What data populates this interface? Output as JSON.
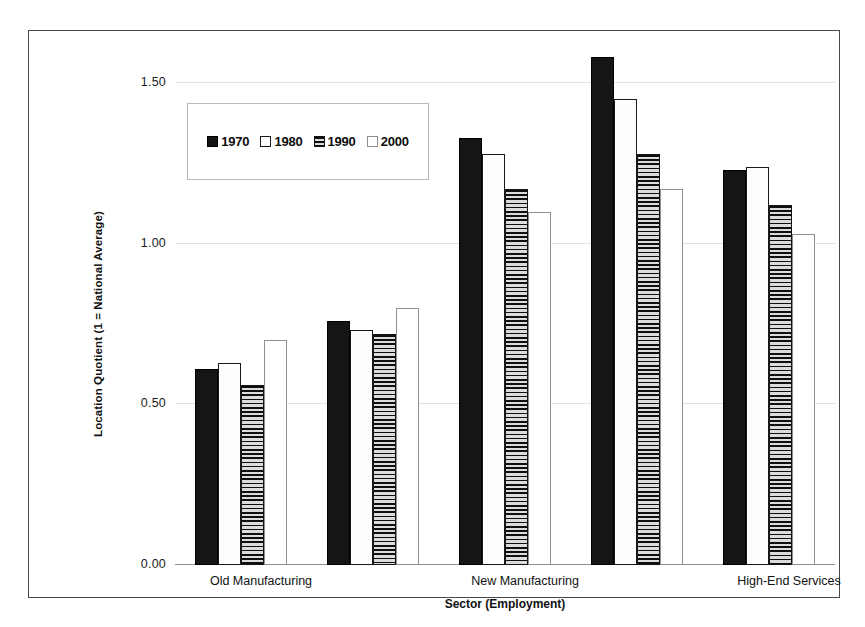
{
  "chart_data": {
    "type": "bar",
    "title": "",
    "subtitle": "",
    "xlabel": "Sector (Employment)",
    "ylabel": "Location Quotient (1 = National Average)",
    "categories": [
      "Old Manufacturing",
      "New Manufacturing",
      "High-End Services",
      "Low-End Services",
      "FIRE"
    ],
    "series": [
      {
        "name": "1970",
        "pattern": "solid-black",
        "values": [
          0.61,
          0.76,
          1.33,
          1.58,
          1.23
        ]
      },
      {
        "name": "1980",
        "pattern": "white-filled",
        "values": [
          0.63,
          0.73,
          1.28,
          1.45,
          1.24
        ]
      },
      {
        "name": "1990",
        "pattern": "horizontal-lines",
        "values": [
          0.56,
          0.72,
          1.17,
          1.28,
          1.12
        ]
      },
      {
        "name": "2000",
        "pattern": "white-outline",
        "values": [
          0.7,
          0.8,
          1.1,
          1.17,
          1.03
        ]
      }
    ],
    "ylim": [
      0.0,
      1.5
    ],
    "yticks": [
      "0.00",
      "0.50",
      "1.00",
      "1.50"
    ],
    "ytick_values": [
      0.0,
      0.5,
      1.0,
      1.5
    ],
    "grid": true,
    "legend_position": "top-left-inside",
    "colors": {
      "series_1970": "#151515",
      "series_1980": "#fdfdfd",
      "series_1990": "#c9c9c9",
      "series_2000": "#ffffff",
      "gridline": "#e2e2e2",
      "axis": "#8d8d8d",
      "frame": "#4a4a4a",
      "text": "#111111"
    }
  }
}
